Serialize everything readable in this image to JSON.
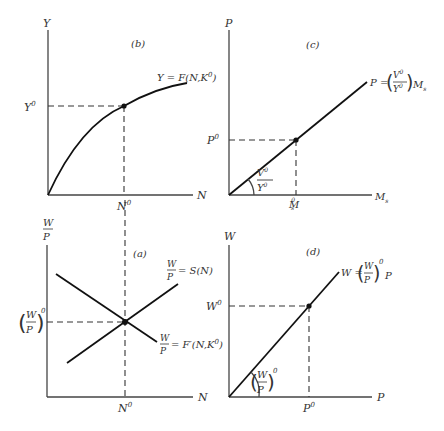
{
  "panels": {
    "b": {
      "tag": "(b)",
      "y_axis": "Y",
      "x_axis": "N",
      "curve_label_left": "Y = F(N,K",
      "curve_label_sup": "0",
      "curve_label_right": ")",
      "y_tick": "Y",
      "y_tick_sup": "0",
      "x_tick": "N",
      "x_tick_sup": "0"
    },
    "c": {
      "tag": "(c)",
      "y_axis": "P",
      "x_axis": "M",
      "x_axis_sub": "s",
      "line_label_lhs": "P =",
      "line_label_num": "V",
      "line_label_den": "Y",
      "line_label_sup": "0",
      "line_label_rhs": "M",
      "line_label_rhs_sub": "s",
      "slope_num": "V",
      "slope_den": "Y",
      "slope_sup": "0",
      "y_tick": "P",
      "y_tick_sup": "0",
      "x_tick": "M",
      "x_tick_sub": "s",
      "x_tick_sup": "0"
    },
    "a": {
      "tag": "(a)",
      "y_axis_num": "W",
      "y_axis_den": "P",
      "x_axis": "N",
      "supply_num": "W",
      "supply_den": "P",
      "supply_rhs": "= S(N)",
      "demand_num": "W",
      "demand_den": "P",
      "demand_rhs": "= F′(N,K",
      "demand_sup": "0",
      "demand_close": ")",
      "y_tick_num": "W",
      "y_tick_den": "P",
      "y_tick_sup": "0",
      "x_tick": "N",
      "x_tick_sup": "0"
    },
    "d": {
      "tag": "(d)",
      "y_axis": "W",
      "x_axis": "P",
      "line_label_lhs": "W =",
      "line_label_num": "W",
      "line_label_den": "P",
      "line_label_sup": "0",
      "line_label_rhs": "P",
      "slope_num": "W",
      "slope_den": "P",
      "slope_sup": "0",
      "y_tick": "W",
      "y_tick_sup": "0",
      "x_tick": "P",
      "x_tick_sup": "0"
    }
  }
}
